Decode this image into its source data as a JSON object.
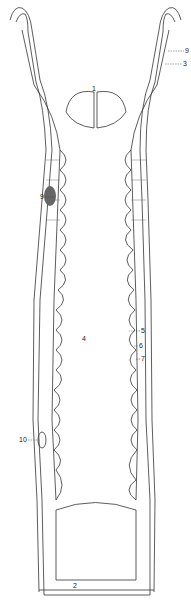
{
  "figure": {
    "stroke_color": "#333333",
    "background": "#ffffff",
    "labels": [
      {
        "id": "1",
        "text": "1",
        "x": 92,
        "y": 88
      },
      {
        "id": "9a",
        "text": "9",
        "x": 186,
        "y": 48
      },
      {
        "id": "3",
        "text": "3",
        "x": 184,
        "y": 61
      },
      {
        "id": "9b",
        "text": "9",
        "x": 41,
        "y": 194
      },
      {
        "id": "4",
        "text": "4",
        "x": 82,
        "y": 336
      },
      {
        "id": "5",
        "text": "5",
        "x": 131,
        "y": 328
      },
      {
        "id": "6",
        "text": "6",
        "x": 136,
        "y": 343
      },
      {
        "id": "7",
        "text": "7",
        "x": 137,
        "y": 356
      },
      {
        "id": "10",
        "text": "10",
        "x": 20,
        "y": 437
      },
      {
        "id": "2",
        "text": "2",
        "x": 72,
        "y": 582
      }
    ]
  }
}
